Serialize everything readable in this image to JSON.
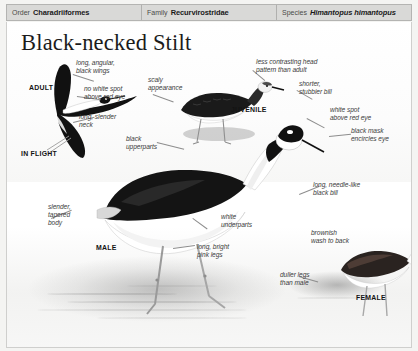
{
  "taxonomy": [
    {
      "key": "Order",
      "value": "Charadriiformes",
      "italic": false
    },
    {
      "key": "Family",
      "value": "Recurvirostridae",
      "italic": false
    },
    {
      "key": "Species",
      "value": "Himantopus himantopus",
      "italic": true
    }
  ],
  "plate": {
    "title": "Black-necked Stilt",
    "stage_labels": [
      {
        "name": "adult",
        "text": "ADULT"
      },
      {
        "name": "in-flight",
        "text": "IN FLIGHT"
      },
      {
        "name": "juvenile",
        "text": "JUVENILE"
      },
      {
        "name": "male",
        "text": "MALE"
      },
      {
        "name": "female",
        "text": "FEMALE"
      }
    ],
    "callouts": [
      {
        "name": "long-angular-black-wings",
        "text": "long, angular,\nblack wings"
      },
      {
        "name": "no-white-spot-above-red-eye",
        "text": "no white spot\nabove red eye"
      },
      {
        "name": "long-slender-neck",
        "text": "long, slender\nneck"
      },
      {
        "name": "black-upperparts",
        "text": "black\nupperparts"
      },
      {
        "name": "scaly-appearance",
        "text": "scaly\nappearance"
      },
      {
        "name": "less-contrasting-head-pattern",
        "text": "less contrasting head\npattern than adult"
      },
      {
        "name": "shorter-stubbier-bill",
        "text": "shorter,\nstubbier bill"
      },
      {
        "name": "white-spot-above-red-eye",
        "text": "white spot\nabove red eye"
      },
      {
        "name": "black-mask-encircles-eye",
        "text": "black mask\nencircles eye"
      },
      {
        "name": "long-needle-like-black-bill",
        "text": "long, needle-like\nblack bill"
      },
      {
        "name": "brownish-wash-to-back",
        "text": "brownish\nwash to back"
      },
      {
        "name": "slender-tapered-body",
        "text": "slender,\ntapered\nbody"
      },
      {
        "name": "white-underparts",
        "text": "white\nunderparts"
      },
      {
        "name": "long-bright-pink-legs",
        "text": "long, bright\npink legs"
      },
      {
        "name": "duller-legs-than-male",
        "text": "duller legs\nthan male"
      }
    ],
    "colors": {
      "plumage_black": "#111111",
      "plumage_white": "#ffffff",
      "paper": "#ffffff",
      "header_bar": "#d9d9d7",
      "callout_text": "#3b3b3b"
    }
  }
}
